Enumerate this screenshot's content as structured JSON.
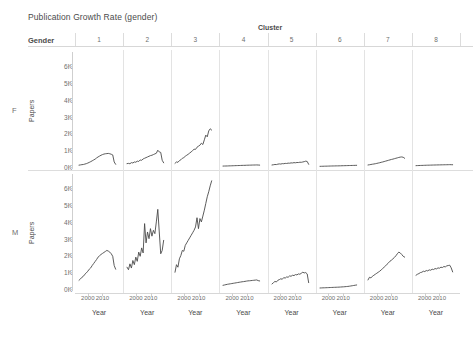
{
  "title": "Publication Growth Rate (gender)",
  "header": {
    "cluster_label": "Cluster",
    "gender_label": "Gender",
    "clusters": [
      "1",
      "2",
      "3",
      "4",
      "5",
      "6",
      "7",
      "8"
    ]
  },
  "rows": [
    {
      "label": "F",
      "y_title": "Papers"
    },
    {
      "label": "M",
      "y_title": "Papers"
    }
  ],
  "axes": {
    "y_ticks": [
      "0K",
      "1K",
      "2K",
      "3K",
      "4K",
      "5K",
      "6K"
    ],
    "y_values": [
      0,
      1000,
      2000,
      3000,
      4000,
      5000,
      6000
    ],
    "y_title": "Papers",
    "x_ticks": [
      "2000",
      "2010"
    ],
    "x_tick_values": [
      2000,
      2010
    ],
    "x_title": "Year",
    "xlim": [
      1994,
      2020
    ],
    "ylim": [
      0,
      6500
    ]
  },
  "chart_data": {
    "type": "line",
    "title": "Publication Growth Rate (gender)",
    "xlabel": "Year",
    "ylabel": "Papers",
    "xlim": [
      1994,
      2020
    ],
    "ylim": [
      0,
      6500
    ],
    "grid": false,
    "legend": "none",
    "facet_rows": [
      "F",
      "M"
    ],
    "facet_cols": [
      "1",
      "2",
      "3",
      "4",
      "5",
      "6",
      "7",
      "8"
    ],
    "x": [
      1994,
      1995,
      1996,
      1997,
      1998,
      1999,
      2000,
      2001,
      2002,
      2003,
      2004,
      2005,
      2006,
      2007,
      2008,
      2009,
      2010,
      2011,
      2012,
      2013,
      2014,
      2015,
      2016,
      2017,
      2018,
      2019
    ],
    "panels": [
      {
        "row": "F",
        "col": "1",
        "values": [
          110,
          125,
          140,
          150,
          175,
          200,
          235,
          275,
          320,
          370,
          420,
          470,
          540,
          600,
          650,
          700,
          740,
          770,
          790,
          800,
          810,
          790,
          760,
          720,
          300,
          160
        ]
      },
      {
        "row": "F",
        "col": "2",
        "values": [
          200,
          215,
          195,
          260,
          240,
          300,
          285,
          350,
          330,
          420,
          400,
          480,
          520,
          560,
          600,
          640,
          680,
          700,
          740,
          780,
          820,
          1000,
          900,
          870,
          400,
          250
        ]
      },
      {
        "row": "F",
        "col": "3",
        "values": [
          220,
          300,
          280,
          380,
          430,
          520,
          560,
          640,
          700,
          760,
          830,
          900,
          980,
          1060,
          1050,
          1180,
          1240,
          1300,
          1420,
          1340,
          1620,
          1900,
          1800,
          2150,
          2280,
          2200
        ]
      },
      {
        "row": "F",
        "col": "4",
        "values": [
          55,
          58,
          60,
          62,
          66,
          70,
          72,
          76,
          80,
          82,
          86,
          88,
          92,
          96,
          98,
          100,
          104,
          108,
          110,
          112,
          116,
          118,
          120,
          122,
          118,
          112
        ]
      },
      {
        "row": "F",
        "col": "5",
        "values": [
          120,
          135,
          150,
          145,
          170,
          185,
          175,
          200,
          195,
          215,
          210,
          230,
          225,
          245,
          240,
          260,
          250,
          270,
          265,
          285,
          280,
          300,
          320,
          350,
          330,
          160
        ]
      },
      {
        "row": "F",
        "col": "6",
        "values": [
          40,
          42,
          45,
          48,
          50,
          52,
          55,
          58,
          60,
          62,
          64,
          66,
          68,
          70,
          72,
          75,
          78,
          80,
          82,
          85,
          88,
          90,
          92,
          95,
          98,
          100
        ]
      },
      {
        "row": "F",
        "col": "7",
        "values": [
          120,
          135,
          150,
          165,
          180,
          195,
          215,
          235,
          255,
          280,
          300,
          325,
          350,
          375,
          400,
          425,
          450,
          470,
          495,
          520,
          545,
          570,
          590,
          600,
          580,
          520
        ]
      },
      {
        "row": "F",
        "col": "8",
        "values": [
          80,
          85,
          88,
          92,
          95,
          98,
          102,
          105,
          108,
          110,
          112,
          115,
          118,
          120,
          122,
          124,
          126,
          128,
          130,
          132,
          134,
          136,
          138,
          140,
          138,
          135
        ]
      },
      {
        "row": "M",
        "col": "1",
        "values": [
          520,
          600,
          700,
          760,
          880,
          960,
          1060,
          1180,
          1260,
          1400,
          1520,
          1640,
          1760,
          1900,
          1980,
          2060,
          2120,
          2180,
          2240,
          2300,
          2260,
          2200,
          2100,
          1950,
          1400,
          1180
        ]
      },
      {
        "row": "M",
        "col": "2",
        "values": [
          1300,
          1150,
          1500,
          1250,
          1700,
          1450,
          1900,
          1650,
          2200,
          1950,
          2450,
          2150,
          3900,
          2750,
          3400,
          3000,
          3600,
          3150,
          3500,
          3300,
          4000,
          4750,
          3400,
          2100,
          2300,
          2900
        ]
      },
      {
        "row": "M",
        "col": "3",
        "values": [
          1000,
          1450,
          1300,
          1800,
          2000,
          2300,
          2250,
          2600,
          2750,
          2900,
          3050,
          3200,
          3350,
          3500,
          3700,
          4250,
          3600,
          4200,
          4000,
          4350,
          4700,
          5100,
          5500,
          5800,
          6150,
          6450
        ]
      },
      {
        "row": "M",
        "col": "4",
        "values": [
          220,
          240,
          260,
          280,
          295,
          310,
          325,
          340,
          355,
          370,
          385,
          400,
          415,
          430,
          440,
          455,
          470,
          485,
          490,
          500,
          510,
          520,
          530,
          540,
          500,
          480
        ]
      },
      {
        "row": "M",
        "col": "5",
        "values": [
          300,
          380,
          450,
          420,
          520,
          560,
          610,
          580,
          680,
          650,
          720,
          700,
          780,
          760,
          820,
          800,
          860,
          840,
          900,
          880,
          940,
          1000,
          960,
          980,
          900,
          380
        ]
      },
      {
        "row": "M",
        "col": "6",
        "values": [
          60,
          65,
          70,
          72,
          76,
          80,
          84,
          88,
          92,
          96,
          100,
          104,
          108,
          112,
          118,
          124,
          130,
          138,
          146,
          154,
          165,
          180,
          195,
          210,
          225,
          240
        ]
      },
      {
        "row": "M",
        "col": "7",
        "values": [
          540,
          700,
          660,
          760,
          820,
          880,
          940,
          1000,
          1060,
          1140,
          1220,
          1300,
          1380,
          1480,
          1560,
          1660,
          1720,
          1800,
          1880,
          1980,
          2100,
          2200,
          2150,
          2060,
          1950,
          1900
        ]
      },
      {
        "row": "M",
        "col": "8",
        "values": [
          820,
          880,
          920,
          980,
          1000,
          1060,
          1040,
          1100,
          1080,
          1140,
          1120,
          1180,
          1160,
          1220,
          1200,
          1260,
          1240,
          1300,
          1280,
          1340,
          1320,
          1380,
          1400,
          1420,
          1260,
          1020
        ]
      }
    ]
  },
  "colors": {
    "line": "#4a4a4a",
    "text": "#4b4b4b",
    "muted_text": "#6e6e6e",
    "rule": "#d7d7d7",
    "separator": "#e3e3e3",
    "background": "#ffffff"
  }
}
